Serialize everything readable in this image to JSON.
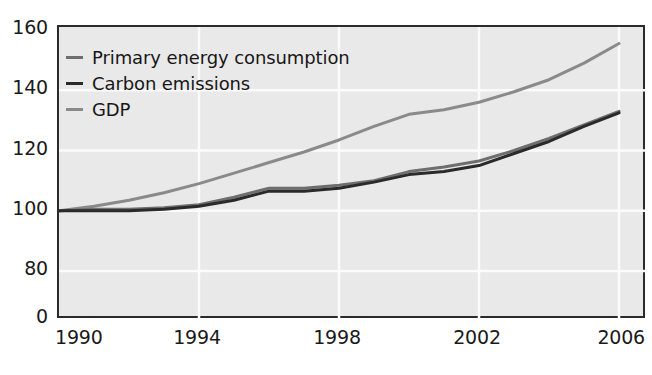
{
  "chart_data": {
    "type": "line",
    "title": "",
    "subtitle": "",
    "xlabel": "",
    "ylabel": "",
    "grid": true,
    "legend_position": "top-left",
    "xlim": [
      1990,
      2006
    ],
    "ylim": [
      0,
      160
    ],
    "y_axis_broken": true,
    "x_ticks": [
      "1990",
      "1994",
      "1998",
      "2002",
      "2006"
    ],
    "x_tick_values": [
      1990,
      1994,
      1998,
      2002,
      2006
    ],
    "y_ticks": [
      "0",
      "80",
      "100",
      "120",
      "140",
      "160"
    ],
    "y_tick_values": [
      0,
      80,
      100,
      120,
      140,
      160
    ],
    "x": [
      1990,
      1991,
      1992,
      1993,
      1994,
      1995,
      1996,
      1997,
      1998,
      1999,
      2000,
      2001,
      2002,
      2003,
      2004,
      2005,
      2006
    ],
    "series": [
      {
        "name": "Primary energy consumption",
        "color": "#6e6e6e",
        "values": [
          100,
          100.5,
          100.5,
          101,
          102,
          104.5,
          107.5,
          107.5,
          108.5,
          110,
          113,
          114.5,
          116.5,
          120,
          124,
          128.5,
          133
        ]
      },
      {
        "name": "Carbon emissions",
        "color": "#2a2a2a",
        "values": [
          100,
          100,
          100,
          100.5,
          101.5,
          103.5,
          106.5,
          106.5,
          107.5,
          109.5,
          112,
          113,
          115,
          119,
          123,
          128,
          132.5
        ]
      },
      {
        "name": "GDP",
        "color": "#8a8a8a",
        "values": [
          100,
          101.5,
          103.5,
          106,
          109,
          112.5,
          116,
          119.5,
          123.5,
          128,
          132,
          133.5,
          136,
          139.5,
          143.5,
          149,
          155.5
        ]
      }
    ]
  },
  "legend": {
    "items": [
      {
        "label": "Primary energy consumption",
        "color": "#6e6e6e"
      },
      {
        "label": "Carbon emissions",
        "color": "#2a2a2a"
      },
      {
        "label": "GDP",
        "color": "#8a8a8a"
      }
    ]
  },
  "axes": {
    "y_ticks": [
      {
        "label": "160",
        "value": 160
      },
      {
        "label": "140",
        "value": 140
      },
      {
        "label": "120",
        "value": 120
      },
      {
        "label": "100",
        "value": 100
      },
      {
        "label": "80",
        "value": 80
      },
      {
        "label": "0",
        "value": 0
      }
    ],
    "x_ticks": [
      {
        "label": "1990",
        "value": 1990
      },
      {
        "label": "1994",
        "value": 1994
      },
      {
        "label": "1998",
        "value": 1998
      },
      {
        "label": "2002",
        "value": 2002
      },
      {
        "label": "2006",
        "value": 2006
      }
    ]
  },
  "style": {
    "plot_background": "#e9e9e9",
    "grid_color": "#fbfbfb",
    "frame_color": "#2b2b2b",
    "page_background": "#ffffff",
    "text_color": "#1a1a1a"
  }
}
